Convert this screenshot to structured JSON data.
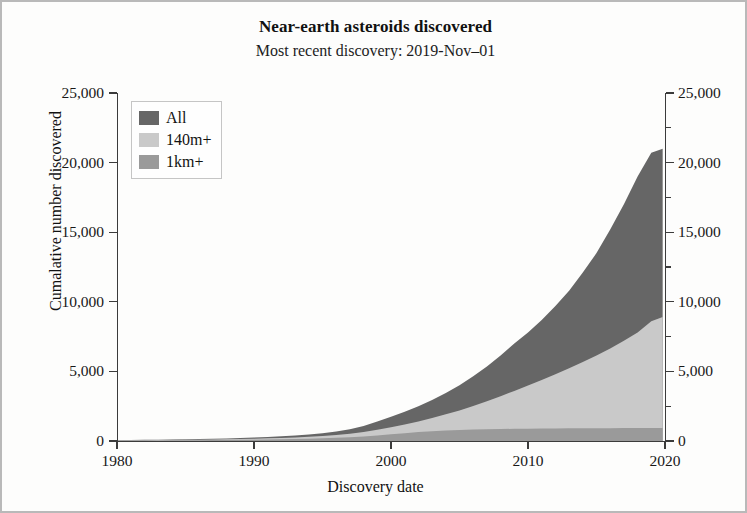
{
  "figure": {
    "title": "Near-earth asteroids discovered",
    "subtitle": "Most recent discovery: 2019-Nov–01"
  },
  "axes": {
    "x_title": "Discovery date",
    "y_title": "Cumalative number discovered",
    "x_ticks": [
      "1980",
      "1990",
      "2000",
      "2010",
      "2020"
    ],
    "y_ticks_left": [
      "25,000",
      "20,000",
      "15,000",
      "10,000",
      "5,000",
      "0"
    ],
    "y_ticks_right": [
      "25,000",
      "20,000",
      "15,000",
      "10,000",
      "5,000",
      "0"
    ]
  },
  "legend": {
    "items": [
      {
        "label": "All",
        "color": "#666666"
      },
      {
        "label": "140m+",
        "color": "#c9c9c9"
      },
      {
        "label": "1km+",
        "color": "#9a9a9a"
      }
    ]
  },
  "chart_data": {
    "type": "area",
    "title": "Near-earth asteroids discovered",
    "subtitle": "Most recent discovery: 2019-Nov–01",
    "xlabel": "Discovery date",
    "ylabel": "Cumalative number discovered",
    "xlim": [
      1980,
      2020
    ],
    "ylim": [
      0,
      25000
    ],
    "xticks": [
      1980,
      1990,
      2000,
      2010,
      2020
    ],
    "yticks": [
      0,
      5000,
      10000,
      15000,
      20000,
      25000
    ],
    "grid": false,
    "stacked": false,
    "legend_position": "top-left",
    "x": [
      1980,
      1981,
      1982,
      1983,
      1984,
      1985,
      1986,
      1987,
      1988,
      1989,
      1990,
      1991,
      1992,
      1993,
      1994,
      1995,
      1996,
      1997,
      1998,
      1999,
      2000,
      2001,
      2002,
      2003,
      2004,
      2005,
      2006,
      2007,
      2008,
      2009,
      2010,
      2011,
      2012,
      2013,
      2014,
      2015,
      2016,
      2017,
      2018,
      2019,
      2019.83
    ],
    "series": [
      {
        "name": "All",
        "color": "#666666",
        "values": [
          60,
          70,
          82,
          95,
          110,
          125,
          140,
          160,
          185,
          215,
          250,
          290,
          340,
          400,
          470,
          560,
          680,
          850,
          1080,
          1400,
          1750,
          2100,
          2500,
          2950,
          3450,
          4000,
          4650,
          5350,
          6150,
          7000,
          7800,
          8700,
          9700,
          10800,
          12100,
          13500,
          15200,
          17000,
          19000,
          20700,
          21000
        ]
      },
      {
        "name": "140m+",
        "color": "#c9c9c9",
        "values": [
          40,
          48,
          56,
          64,
          74,
          84,
          94,
          108,
          124,
          143,
          165,
          190,
          220,
          258,
          300,
          355,
          425,
          520,
          640,
          800,
          980,
          1180,
          1400,
          1650,
          1920,
          2200,
          2520,
          2860,
          3220,
          3600,
          3980,
          4380,
          4800,
          5230,
          5680,
          6150,
          6650,
          7200,
          7800,
          8600,
          8900
        ]
      },
      {
        "name": "1km+",
        "color": "#9a9a9a",
        "values": [
          25,
          30,
          35,
          40,
          46,
          52,
          58,
          66,
          75,
          86,
          98,
          112,
          128,
          148,
          170,
          198,
          232,
          275,
          330,
          400,
          480,
          560,
          640,
          700,
          750,
          790,
          820,
          845,
          862,
          876,
          886,
          894,
          901,
          907,
          912,
          917,
          921,
          925,
          929,
          933,
          935
        ]
      }
    ]
  }
}
